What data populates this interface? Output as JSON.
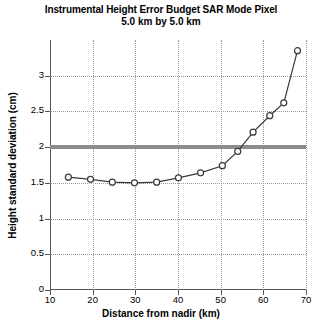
{
  "chart_data": {
    "type": "line",
    "title": "Instrumental Height Error Budget SAR Mode Pixel",
    "subtitle": "5.0 km by 5.0 km",
    "xlabel": "Distance from nadir (km)",
    "ylabel": "Height standard deviation (cm)",
    "xlim": [
      10,
      70
    ],
    "ylim": [
      0,
      3.5
    ],
    "xticks": [
      10,
      20,
      30,
      40,
      50,
      60,
      70
    ],
    "xtick_labels": [
      "10",
      "20",
      "30",
      "40",
      "50",
      "60",
      "70"
    ],
    "yticks": [
      0,
      0.5,
      1,
      1.5,
      2,
      2.5,
      3
    ],
    "ytick_labels": [
      "0",
      "0.5",
      "1",
      "1.5",
      "2",
      "2.5",
      "3"
    ],
    "grid": true,
    "grid_style": "dotted",
    "legend": false,
    "series": [
      {
        "name": "height standard deviation",
        "marker": "open-circle",
        "color": "#3a3a3a",
        "x": [
          14.3,
          19.5,
          24.6,
          29.8,
          35.0,
          40.1,
          45.3,
          50.4,
          54.0,
          57.6,
          61.5,
          64.8,
          68.0
        ],
        "values": [
          1.58,
          1.55,
          1.51,
          1.5,
          1.51,
          1.57,
          1.64,
          1.74,
          1.94,
          2.21,
          2.44,
          2.62,
          3.35
        ]
      }
    ],
    "reference_lines": [
      {
        "name": "requirement-threshold",
        "orientation": "horizontal",
        "value": 2.0,
        "color": "#8c8c8c",
        "width_px": 4
      }
    ],
    "axis_color": "#555555",
    "background": "#ffffff"
  }
}
